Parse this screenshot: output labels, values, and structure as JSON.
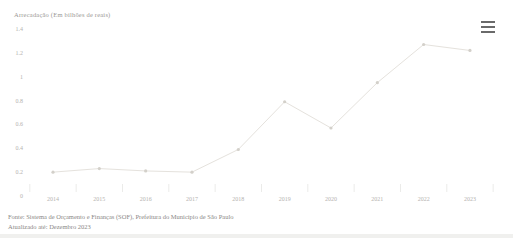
{
  "chart": {
    "title": "Arrecadação (Em bilhões de reais)",
    "menu_icon": "hamburger-menu-icon"
  },
  "chart_data": {
    "type": "line",
    "title": "Arrecadação (Em bilhões de reais)",
    "categories": [
      "2014",
      "2015",
      "2016",
      "2017",
      "2018",
      "2019",
      "2020",
      "2021",
      "2022",
      "2023"
    ],
    "values": [
      0.2,
      0.23,
      0.21,
      0.2,
      0.39,
      0.79,
      0.57,
      0.95,
      1.27,
      1.22
    ],
    "series_name": "Arrecadação",
    "xlabel": "",
    "ylabel": "",
    "ylim": [
      0,
      1.4
    ],
    "ytick_step": 0.2,
    "yticks": [
      "0",
      "0.2",
      "0.4",
      "0.6",
      "0.8",
      "1",
      "1.2",
      "1.4"
    ],
    "grid": false,
    "legend": false,
    "line_color": "#e5e2dd",
    "marker_color": "#d3d0ca",
    "axis_label_color": "#b5b3b0"
  },
  "footer": {
    "source": "Fonte: Sistema de Orçamento e Finanças (SOF), Prefeitura do Município de São Paulo",
    "updated": "Atualizado até: Dezembro 2023"
  }
}
